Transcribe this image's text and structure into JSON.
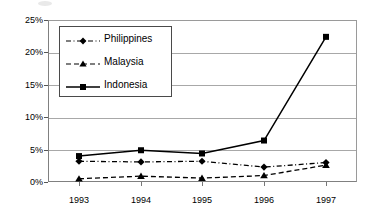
{
  "chart_data": {
    "type": "line",
    "title": "",
    "xlabel": "",
    "ylabel": "",
    "categories": [
      "1993",
      "1994",
      "1995",
      "1996",
      "1997"
    ],
    "x": [
      1993,
      1994,
      1995,
      1996,
      1997
    ],
    "ylim": [
      0,
      25
    ],
    "yticks": [
      0,
      5,
      10,
      15,
      20,
      25
    ],
    "ytick_labels": [
      "0%",
      "5%",
      "10%",
      "15%",
      "20%",
      "25%"
    ],
    "y_unit": "percent",
    "grid": "horizontal",
    "legend_position": "upper-left-inside",
    "series": [
      {
        "name": "Philippines",
        "values": [
          3.2,
          3.1,
          3.2,
          2.3,
          3.0
        ],
        "marker": "diamond",
        "line_style": "dash-dot",
        "color": "#000000"
      },
      {
        "name": "Malaysia",
        "values": [
          0.5,
          0.9,
          0.6,
          1.0,
          2.6
        ],
        "marker": "triangle",
        "line_style": "dashed",
        "color": "#000000"
      },
      {
        "name": "Indonesia",
        "values": [
          4.0,
          4.9,
          4.4,
          6.4,
          22.4
        ],
        "marker": "square",
        "line_style": "solid",
        "color": "#000000"
      }
    ]
  },
  "legend": {
    "items": [
      {
        "label": "Philippines"
      },
      {
        "label": "Malaysia"
      },
      {
        "label": "Indonesia"
      }
    ]
  },
  "axes": {
    "y_labels": [
      "25%",
      "20%",
      "15%",
      "10%",
      "5%",
      "0%"
    ],
    "x_labels": [
      "1993",
      "1994",
      "1995",
      "1996",
      "1997"
    ]
  },
  "colors": {
    "ink": "#000000",
    "grid": "#a8a8a8",
    "frame": "#808080",
    "background": "#ffffff"
  }
}
